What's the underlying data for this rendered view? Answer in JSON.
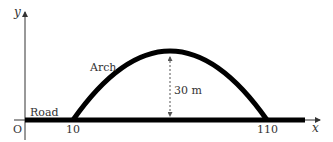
{
  "diagram": {
    "type": "parabolic-arch-over-road",
    "axes": {
      "x_label": "x",
      "y_label": "y",
      "origin_label": "O"
    },
    "labels": {
      "road": "Road",
      "arch": "Arch",
      "height": "30 m"
    },
    "ticks": {
      "left_foot": "10",
      "right_foot": "110"
    },
    "colors": {
      "stroke": "#000000",
      "text": "#333333",
      "dashed": "#555555"
    }
  }
}
